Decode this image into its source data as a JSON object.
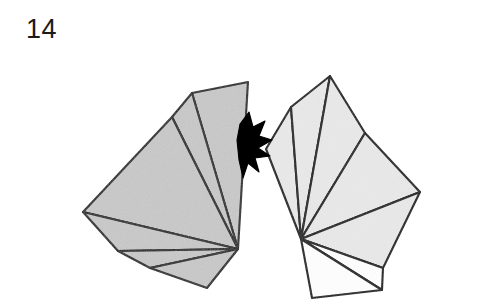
{
  "figure": {
    "label": "14",
    "caption_number": "14",
    "background_color": "#ffffff",
    "stroke_color": "#1c1c1c",
    "left_fan": {
      "name": "left-polygon-fan",
      "fill_color": "#c9c9c9",
      "hub": [
        238,
        249
      ],
      "rim": [
        [
          248,
          82
        ],
        [
          192,
          93
        ],
        [
          172,
          117
        ],
        [
          83,
          212
        ],
        [
          118,
          251
        ],
        [
          150,
          268
        ],
        [
          207,
          288
        ]
      ],
      "closing_edges": [
        [
          238,
          249
        ],
        [
          248,
          82
        ]
      ]
    },
    "right_fan": {
      "name": "right-polygon-fan",
      "fill_color": "#e9e9e9",
      "white_fill_color": "#ffffff",
      "hub": [
        301,
        239
      ],
      "rim": [
        [
          266,
          149
        ],
        [
          291,
          107
        ],
        [
          330,
          76
        ],
        [
          365,
          133
        ],
        [
          420,
          192
        ],
        [
          383,
          268
        ],
        [
          382,
          290
        ],
        [
          312,
          298
        ]
      ],
      "shaded_rim_count": 5
    },
    "black_shape": {
      "name": "black-star-arrow",
      "fill_color": "#000000",
      "points": [
        [
          249,
          112
        ],
        [
          253,
          127
        ],
        [
          265,
          121
        ],
        [
          259,
          136
        ],
        [
          272,
          140
        ],
        [
          258,
          148
        ],
        [
          270,
          156
        ],
        [
          255,
          158
        ],
        [
          259,
          172
        ],
        [
          248,
          163
        ],
        [
          243,
          178
        ],
        [
          239,
          160
        ],
        [
          237,
          140
        ],
        [
          240,
          124
        ]
      ]
    }
  }
}
